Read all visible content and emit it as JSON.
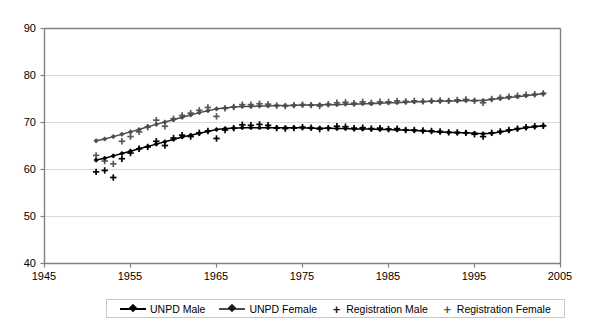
{
  "chart_data": {
    "type": "line",
    "title": "",
    "xlabel": "",
    "ylabel": "",
    "xlim": [
      1945,
      2005
    ],
    "ylim": [
      40,
      90
    ],
    "xticks": [
      1945,
      1955,
      1965,
      1975,
      1985,
      1995,
      2005
    ],
    "yticks": [
      40,
      50,
      60,
      70,
      80,
      90
    ],
    "grid": "horizontal",
    "legend_position": "bottom",
    "series": [
      {
        "name": "UNPD Male",
        "style": "line-with-diamond-markers",
        "color": "#000000",
        "x": [
          1951,
          1952,
          1953,
          1954,
          1955,
          1956,
          1957,
          1958,
          1959,
          1960,
          1961,
          1962,
          1963,
          1964,
          1965,
          1966,
          1967,
          1968,
          1969,
          1970,
          1971,
          1972,
          1973,
          1974,
          1975,
          1976,
          1977,
          1978,
          1979,
          1980,
          1981,
          1982,
          1983,
          1984,
          1985,
          1986,
          1987,
          1988,
          1989,
          1990,
          1991,
          1992,
          1993,
          1994,
          1995,
          1996,
          1997,
          1998,
          1999,
          2000,
          2001,
          2002,
          2003
        ],
        "values": [
          62.0,
          62.4,
          62.9,
          63.4,
          63.9,
          64.4,
          64.9,
          65.4,
          65.9,
          66.4,
          66.9,
          67.3,
          67.7,
          68.1,
          68.5,
          68.7,
          68.8,
          68.9,
          68.9,
          68.9,
          68.9,
          68.9,
          68.9,
          68.9,
          68.9,
          68.8,
          68.8,
          68.8,
          68.7,
          68.7,
          68.6,
          68.6,
          68.6,
          68.5,
          68.5,
          68.4,
          68.4,
          68.3,
          68.2,
          68.1,
          68.0,
          67.9,
          67.8,
          67.8,
          67.7,
          67.6,
          67.7,
          68.0,
          68.3,
          68.6,
          68.9,
          69.1,
          69.3
        ]
      },
      {
        "name": "UNPD Female",
        "style": "line-with-diamond-markers",
        "color": "#4d4d4d",
        "x": [
          1951,
          1952,
          1953,
          1954,
          1955,
          1956,
          1957,
          1958,
          1959,
          1960,
          1961,
          1962,
          1963,
          1964,
          1965,
          1966,
          1967,
          1968,
          1969,
          1970,
          1971,
          1972,
          1973,
          1974,
          1975,
          1976,
          1977,
          1978,
          1979,
          1980,
          1981,
          1982,
          1983,
          1984,
          1985,
          1986,
          1987,
          1988,
          1989,
          1990,
          1991,
          1992,
          1993,
          1994,
          1995,
          1996,
          1997,
          1998,
          1999,
          2000,
          2001,
          2002,
          2003
        ],
        "values": [
          66.1,
          66.5,
          67.0,
          67.5,
          68.0,
          68.5,
          69.1,
          69.6,
          70.1,
          70.6,
          71.1,
          71.6,
          72.1,
          72.5,
          72.9,
          73.1,
          73.3,
          73.4,
          73.4,
          73.5,
          73.5,
          73.6,
          73.6,
          73.6,
          73.7,
          73.7,
          73.8,
          73.8,
          73.8,
          73.9,
          73.9,
          74.0,
          74.0,
          74.1,
          74.2,
          74.2,
          74.3,
          74.4,
          74.4,
          74.5,
          74.5,
          74.6,
          74.6,
          74.7,
          74.7,
          74.7,
          74.9,
          75.1,
          75.3,
          75.5,
          75.7,
          75.9,
          76.1
        ]
      },
      {
        "name": "Registration Male",
        "style": "plus-markers-only",
        "color": "#000000",
        "x": [
          1951,
          1952,
          1953,
          1954,
          1955,
          1956,
          1957,
          1958,
          1959,
          1960,
          1961,
          1962,
          1963,
          1964,
          1965,
          1966,
          1967,
          1968,
          1969,
          1970,
          1971,
          1972,
          1973,
          1974,
          1975,
          1976,
          1977,
          1978,
          1979,
          1980,
          1981,
          1982,
          1983,
          1984,
          1985,
          1986,
          1987,
          1988,
          1989,
          1990,
          1991,
          1992,
          1993,
          1994,
          1995,
          1996,
          1997,
          1998,
          1999,
          2000,
          2001,
          2002,
          2003
        ],
        "values": [
          59.5,
          59.8,
          58.3,
          62.3,
          63.5,
          64.4,
          64.8,
          66.0,
          65.1,
          66.7,
          67.3,
          67.0,
          67.8,
          68.2,
          66.6,
          68.4,
          68.8,
          69.5,
          69.4,
          69.6,
          69.4,
          68.8,
          68.7,
          68.8,
          69.0,
          68.9,
          68.6,
          68.8,
          69.2,
          69.1,
          68.8,
          68.9,
          68.7,
          68.8,
          68.6,
          68.7,
          68.4,
          68.4,
          68.3,
          68.2,
          68.1,
          67.9,
          67.9,
          67.8,
          67.5,
          67.0,
          67.8,
          68.1,
          68.4,
          68.7,
          69.0,
          69.2,
          69.3
        ]
      },
      {
        "name": "Registration Female",
        "style": "plus-markers-only",
        "color": "#595959",
        "x": [
          1951,
          1952,
          1953,
          1954,
          1955,
          1956,
          1957,
          1958,
          1959,
          1960,
          1961,
          1962,
          1963,
          1964,
          1965,
          1966,
          1967,
          1968,
          1969,
          1970,
          1971,
          1972,
          1973,
          1974,
          1975,
          1976,
          1977,
          1978,
          1979,
          1980,
          1981,
          1982,
          1983,
          1984,
          1985,
          1986,
          1987,
          1988,
          1989,
          1990,
          1991,
          1992,
          1993,
          1994,
          1995,
          1996,
          1997,
          1998,
          1999,
          2000,
          2001,
          2002,
          2003
        ],
        "values": [
          63.0,
          61.8,
          61.2,
          66.0,
          67.0,
          68.0,
          69.0,
          70.5,
          69.2,
          70.8,
          71.5,
          72.0,
          72.6,
          73.2,
          71.3,
          73.0,
          73.3,
          73.8,
          73.8,
          74.0,
          73.9,
          73.6,
          73.5,
          73.7,
          73.8,
          73.7,
          73.5,
          73.9,
          74.2,
          74.3,
          74.1,
          74.4,
          74.2,
          74.4,
          74.4,
          74.6,
          74.5,
          74.6,
          74.5,
          74.6,
          74.7,
          74.6,
          74.8,
          74.9,
          74.6,
          74.2,
          75.0,
          75.3,
          75.5,
          75.7,
          75.9,
          76.0,
          76.2
        ]
      }
    ]
  },
  "axes": {
    "y_labels": [
      "90",
      "80",
      "70",
      "60",
      "50",
      "40"
    ],
    "x_labels": [
      "1945",
      "1955",
      "1965",
      "1975",
      "1985",
      "1995",
      "2005"
    ]
  },
  "legend": {
    "items": [
      {
        "label": "UNPD Male",
        "icon": "line-diamond-marker"
      },
      {
        "label": "UNPD Female",
        "icon": "line-diamond-marker"
      },
      {
        "label": "Registration Male",
        "icon": "plus-marker"
      },
      {
        "label": "Registration Female",
        "icon": "plus-marker"
      }
    ]
  },
  "colors": {
    "axis": "#808080",
    "grid": "#d9d9d9",
    "male": "#000000",
    "female": "#4d4d4d"
  }
}
